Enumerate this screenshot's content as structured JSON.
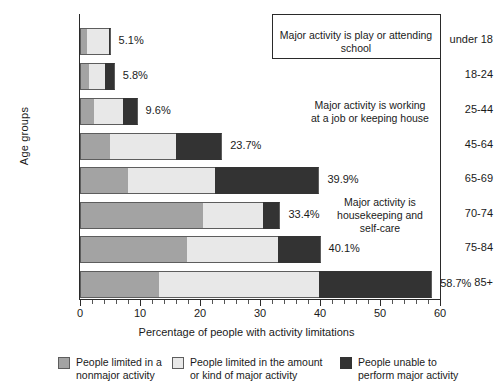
{
  "chart_data": {
    "type": "bar",
    "orientation": "horizontal",
    "stacked": true,
    "title": "",
    "xlabel": "Percentage of people with activity limitations",
    "ylabel": "Age groups",
    "xlim": [
      0,
      60
    ],
    "xticks": [
      0,
      10,
      20,
      30,
      40,
      50,
      60
    ],
    "xtick_labels": [
      "0",
      "10",
      "20",
      "30",
      "40",
      "50",
      "60"
    ],
    "grid": false,
    "legend_position": "bottom",
    "categories": [
      "under 18",
      "18-24",
      "25-44",
      "45-64",
      "65-69",
      "70-74",
      "75-84",
      "85+"
    ],
    "series": [
      {
        "name": "People limited in a nonmajor activity",
        "color": "#a3a3a3",
        "values": [
          1.2,
          1.5,
          2.3,
          5.0,
          8.0,
          20.5,
          17.8,
          13.1
        ]
      },
      {
        "name": "People limited in the amount or kind of major activity",
        "color": "#e8e8e8",
        "values": [
          3.7,
          2.6,
          4.9,
          11.0,
          14.5,
          10.0,
          15.2,
          26.8
        ]
      },
      {
        "name": "People unable to perform major activity",
        "color": "#333333",
        "values": [
          0.2,
          1.7,
          2.4,
          7.7,
          17.4,
          2.9,
          7.1,
          18.8
        ]
      }
    ],
    "totals": [
      5.1,
      5.8,
      9.6,
      23.7,
      39.9,
      33.4,
      40.1,
      58.7
    ],
    "total_labels": [
      "5.1%",
      "5.8%",
      "9.6%",
      "23.7%",
      "39.9%",
      "33.4%",
      "40.1%",
      "58.7%"
    ],
    "annotations": [
      {
        "id": "annotation-play-school",
        "text": "Major activity is play or attending school",
        "applies_to": [
          "under 18"
        ]
      },
      {
        "id": "annotation-working-job",
        "text": "Major activity is working\nat a job or keeping house",
        "applies_to": [
          "18-24",
          "25-44",
          "45-64",
          "65-69"
        ]
      },
      {
        "id": "annotation-housekeeping",
        "text": "Major activity is\nhousekeeping and\nself-care",
        "applies_to": [
          "70-74",
          "75-84",
          "85+"
        ]
      }
    ],
    "legend": [
      {
        "swatch": "#a3a3a3",
        "label": "People limited in a\nnonmajor activity"
      },
      {
        "swatch": "#e8e8e8",
        "label": "People limited in the amount\nor kind of major activity"
      },
      {
        "swatch": "#333333",
        "label": "People unable to\nperform major activity"
      }
    ]
  }
}
